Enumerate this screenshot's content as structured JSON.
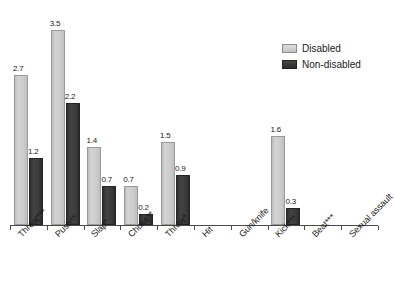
{
  "chart_data": {
    "type": "bar",
    "title": "",
    "subtitle": "",
    "xlabel": "",
    "ylabel": "",
    "ylim": [
      0,
      3.9
    ],
    "grid": false,
    "legend_position": "top-right",
    "categories": [
      "Threat***",
      "Push**",
      "Slap*",
      "Choke**",
      "Throw*",
      "Hit",
      "Gun/knife",
      "Kick***",
      "Beat***",
      "Sexual assault"
    ],
    "series": [
      {
        "name": "Disabled",
        "color": "#cccccc",
        "values": [
          2.7,
          3.5,
          1.4,
          0.7,
          1.5,
          0,
          0,
          1.6,
          0,
          0
        ],
        "labels": [
          "2.7",
          "3.5",
          "1.4",
          "0.7",
          "1.5",
          "",
          "",
          "1.6",
          "",
          ""
        ]
      },
      {
        "name": "Non-disabled",
        "color": "#3a3a3a",
        "values": [
          1.2,
          2.2,
          0.7,
          0.2,
          0.9,
          0,
          0,
          0.3,
          0,
          0
        ],
        "labels": [
          "1.2",
          "2.2",
          "0.7",
          "0.2",
          "0.9",
          "",
          "",
          "0.3",
          "",
          ""
        ]
      }
    ]
  },
  "legend": {
    "items": [
      {
        "label": "Disabled",
        "color": "#cccccc"
      },
      {
        "label": "Non-disabled",
        "color": "#3a3a3a"
      }
    ]
  }
}
